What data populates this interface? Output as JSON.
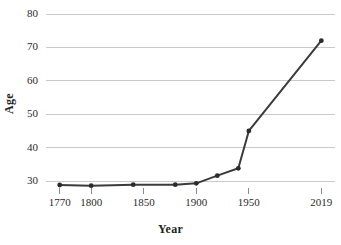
{
  "chart_data": {
    "type": "line",
    "title": "",
    "xlabel": "Year",
    "ylabel": "Age",
    "x": [
      1770,
      1800,
      1840,
      1880,
      1900,
      1920,
      1940,
      1950,
      2019
    ],
    "values": [
      28.8,
      28.6,
      28.9,
      28.9,
      29.3,
      31.6,
      33.8,
      45.0,
      72.0
    ],
    "series": [
      {
        "name": "Age",
        "values": [
          28.8,
          28.6,
          28.9,
          28.9,
          29.3,
          31.6,
          33.8,
          45.0,
          72.0
        ]
      }
    ],
    "xlim": [
      1757,
      2032
    ],
    "ylim": [
      26,
      80
    ],
    "ytick_labels": [
      "80",
      "70",
      "60",
      "50",
      "40",
      "30"
    ],
    "ytick_values": [
      80,
      70,
      60,
      50,
      40,
      30
    ],
    "xtick_labels": [
      "1770",
      "1800",
      "1850",
      "1900",
      "1950",
      "2019"
    ],
    "xtick_values": [
      1770,
      1800,
      1850,
      1900,
      1950,
      2019
    ],
    "grid": "horizontal",
    "legend": "none",
    "line_color": "#3b3b3b",
    "marker_color": "#2b2b2b",
    "grid_color": "#c9c9c9"
  },
  "axes": {
    "y_title": "Age",
    "x_title": "Year"
  }
}
